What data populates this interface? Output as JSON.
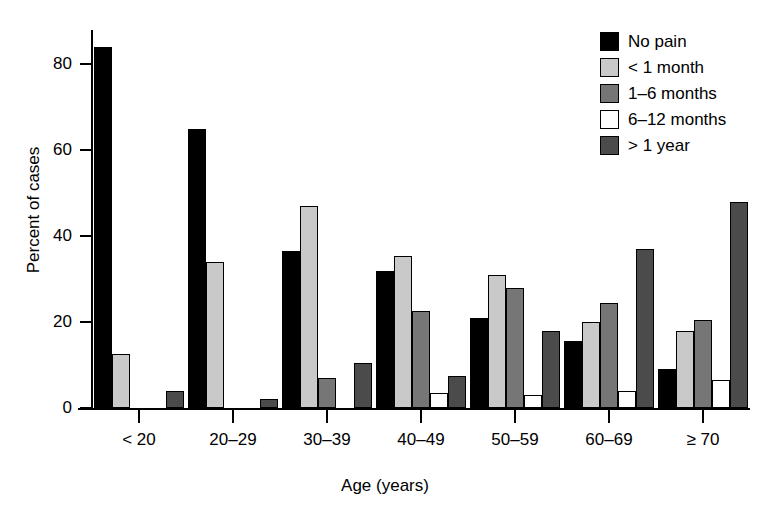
{
  "chart_data": {
    "type": "bar",
    "title": "",
    "xlabel": "Age (years)",
    "ylabel": "Percent of cases",
    "categories": [
      "< 20",
      "20–29",
      "30–39",
      "40–49",
      "50–59",
      "60–69",
      "≥ 70"
    ],
    "series": [
      {
        "name": "No pain",
        "color": "#000000",
        "values": [
          84,
          65,
          36.5,
          32,
          21,
          15.5,
          9
        ]
      },
      {
        "name": "< 1 month",
        "color": "#c9c9c9",
        "values": [
          12.5,
          34,
          47,
          35.5,
          31,
          20,
          18
        ]
      },
      {
        "name": "1–6 months",
        "color": "#767676",
        "values": [
          0,
          0,
          7,
          22.5,
          28,
          24.5,
          20.5
        ]
      },
      {
        "name": "6–12 months",
        "color": "#ffffff",
        "values": [
          0,
          0,
          0,
          3.5,
          3,
          4,
          6.5
        ]
      },
      {
        "name": "> 1 year",
        "color": "#4b4b4b",
        "values": [
          4,
          2,
          10.5,
          7.5,
          18,
          37,
          48
        ]
      }
    ],
    "ylim": [
      0,
      88
    ],
    "yticks": [
      0,
      20,
      40,
      60,
      80
    ],
    "ytick_labels": [
      "0",
      "20",
      "40",
      "60",
      "80"
    ],
    "grid": false,
    "legend_position": "top-right"
  }
}
